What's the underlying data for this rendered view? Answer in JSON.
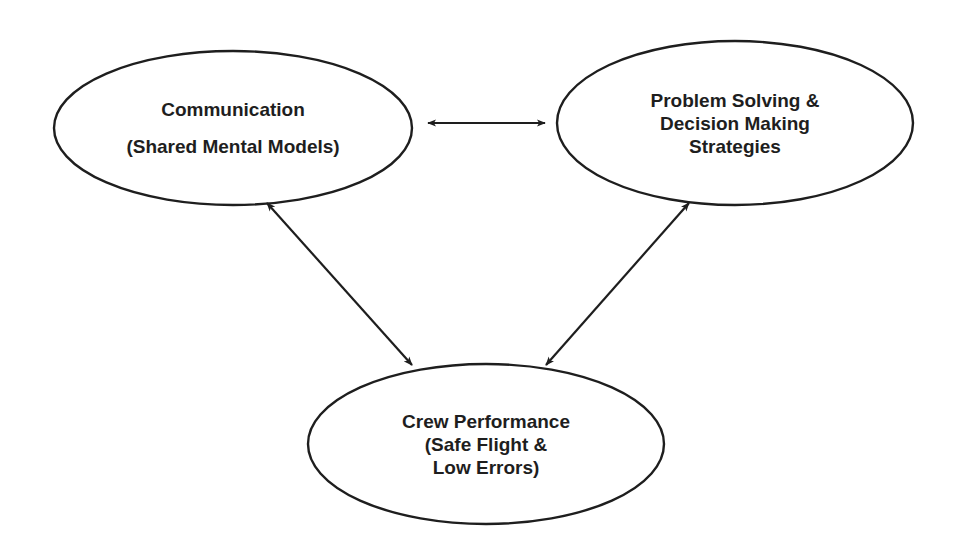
{
  "diagram": {
    "colors": {
      "stroke": "#1e1e1e",
      "background": "#ffffff",
      "text": "#1e1e1e"
    },
    "nodes": [
      {
        "id": "communication",
        "lines": [
          "Communication",
          "",
          "(Shared Mental Models)"
        ],
        "cx": 233,
        "cy": 128,
        "rx": 179,
        "ry": 77
      },
      {
        "id": "problem-solving",
        "lines": [
          "Problem Solving &",
          "Decision Making",
          "Strategies"
        ],
        "cx": 735,
        "cy": 123,
        "rx": 178,
        "ry": 82
      },
      {
        "id": "crew-performance",
        "lines": [
          "Crew Performance",
          "(Safe Flight &",
          "Low Errors)"
        ],
        "cx": 486,
        "cy": 444,
        "rx": 178,
        "ry": 80
      }
    ],
    "edges": [
      {
        "from": "communication",
        "to": "problem-solving",
        "type": "bidirectional",
        "x1": 428,
        "y1": 123,
        "x2": 545,
        "y2": 123
      },
      {
        "from": "communication",
        "to": "crew-performance",
        "type": "bidirectional",
        "x1": 267,
        "y1": 203,
        "x2": 412,
        "y2": 365
      },
      {
        "from": "problem-solving",
        "to": "crew-performance",
        "type": "bidirectional",
        "x1": 689,
        "y1": 203,
        "x2": 546,
        "y2": 365
      }
    ]
  }
}
